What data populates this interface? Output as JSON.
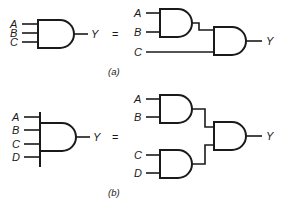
{
  "diagram": {
    "parts": [
      {
        "id": "a",
        "caption": "(a)",
        "left": {
          "inputs": [
            "A",
            "B",
            "C"
          ],
          "output": "Y",
          "gate": "AND-3"
        },
        "equals": "=",
        "right": {
          "inputs": [
            "A",
            "B",
            "C"
          ],
          "output": "Y",
          "gates": [
            {
              "name": "AND1",
              "inputs": [
                "A",
                "B"
              ]
            },
            {
              "name": "AND2",
              "inputs": [
                "AND1",
                "C"
              ]
            }
          ]
        }
      },
      {
        "id": "b",
        "caption": "(b)",
        "left": {
          "inputs": [
            "A",
            "B",
            "C",
            "D"
          ],
          "output": "Y",
          "gate": "AND-4"
        },
        "equals": "=",
        "right": {
          "inputs": [
            "A",
            "B",
            "C",
            "D"
          ],
          "output": "Y",
          "gates": [
            {
              "name": "AND1",
              "inputs": [
                "A",
                "B"
              ]
            },
            {
              "name": "AND2",
              "inputs": [
                "C",
                "D"
              ]
            },
            {
              "name": "AND3",
              "inputs": [
                "AND1",
                "AND2"
              ]
            }
          ]
        }
      }
    ],
    "colors": {
      "stroke": "#1a1a1a",
      "background": "#ffffff"
    }
  }
}
